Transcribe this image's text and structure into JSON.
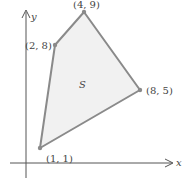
{
  "diagram": {
    "region_label": "S",
    "axes": {
      "x_label": "x",
      "y_label": "y"
    },
    "vertices": [
      {
        "label": "(1, 1)",
        "x": 1,
        "y": 1
      },
      {
        "label": "(2, 8)",
        "x": 2,
        "y": 8
      },
      {
        "label": "(4, 9)",
        "x": 4,
        "y": 9
      },
      {
        "label": "(8, 5)",
        "x": 8,
        "y": 5
      }
    ],
    "colors": {
      "fill": "#f1f1f1",
      "edge": "#8a8a8a",
      "axis": "#555555"
    }
  }
}
